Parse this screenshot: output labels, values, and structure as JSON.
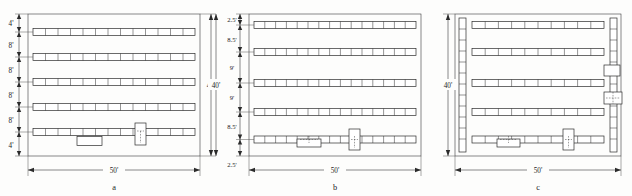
{
  "figure": {
    "background_color": "#fdfdfc",
    "line_color": "#2b2b2b",
    "unit_symbol": "'"
  },
  "panels": [
    {
      "id": "a",
      "caption": "a",
      "overall": {
        "width_label": "50'",
        "height_label": "40'",
        "height_side": "right"
      },
      "vertical_dimensions": [
        "4'",
        "8'",
        "8'",
        "8'",
        "8'",
        "4'"
      ],
      "rows": 5,
      "stalls_per_row": 13,
      "side_racks": 0,
      "markers": [
        {
          "name": "island-box",
          "row": 5,
          "kind": "rect-below"
        },
        {
          "name": "booth-box",
          "row": 5,
          "kind": "rect-straddle"
        }
      ]
    },
    {
      "id": "b",
      "caption": "b",
      "overall": {
        "width_label": "50'",
        "height_label": "40'",
        "height_side": "left"
      },
      "vertical_dimensions": [
        "2.5'",
        "8.5'",
        "9'",
        "9'",
        "8.5'",
        "2.5'"
      ],
      "rows": 5,
      "stalls_per_row": 15,
      "side_racks": 0,
      "markers": [
        {
          "name": "island-box",
          "row": 5,
          "kind": "rect-below-dashed"
        },
        {
          "name": "booth-box",
          "row": 5,
          "kind": "rect-straddle"
        }
      ]
    },
    {
      "id": "c",
      "caption": "c",
      "overall": {
        "width_label": "50'",
        "height_label": "40'",
        "height_side": "left"
      },
      "vertical_dimensions": [],
      "rows": 5,
      "stalls_per_row": 11,
      "side_racks": 2,
      "side_rack_stalls": 12,
      "markers": [
        {
          "name": "island-box",
          "row": 5,
          "kind": "rect-below-dashed"
        },
        {
          "name": "booth-box",
          "row": 5,
          "kind": "rect-straddle"
        },
        {
          "name": "right-booth-upper",
          "kind": "rect-right-edge"
        },
        {
          "name": "right-booth-lower",
          "kind": "rect-right-edge-dashed"
        }
      ]
    }
  ],
  "labels": {
    "panel_a_caption": "a",
    "panel_b_caption": "b",
    "panel_c_caption": "c",
    "a_width": "50'",
    "a_height": "40'",
    "a_dim_1": "4'",
    "a_dim_2": "8'",
    "a_dim_3": "8'",
    "a_dim_4": "8'",
    "a_dim_5": "8'",
    "a_dim_6": "4'",
    "b_width": "50'",
    "b_height": "40'",
    "b_dim_1": "2.5'",
    "b_dim_2": "8.5'",
    "b_dim_3": "9'",
    "b_dim_4": "9'",
    "b_dim_5": "8.5'",
    "b_dim_6": "2.5'",
    "c_width": "50'",
    "c_height": "40'"
  }
}
